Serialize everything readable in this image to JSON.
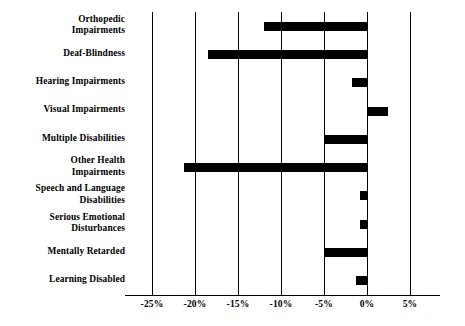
{
  "chart_data": {
    "type": "bar",
    "orientation": "horizontal",
    "title": "",
    "subtitle": "",
    "xlabel": "",
    "ylabel": "",
    "xlim": [
      -27.5,
      7.5
    ],
    "grid": true,
    "legend": null,
    "bar_color": "#000000",
    "axis_color": "#000000",
    "background": "#ffffff",
    "xticks": [
      -25,
      -20,
      -15,
      -10,
      -5,
      0,
      5
    ],
    "xtick_labels": [
      "-25%",
      "-20%",
      "-15%",
      "-10%",
      "-5%",
      "0%",
      "5%"
    ],
    "categories": [
      "Orthopedic\nImpairments",
      "Deaf-Blindness",
      "Hearing Impairments",
      "Visual Impairments",
      "Multiple Disabilities",
      "Other Health\nImpairments",
      "Speech and Language\nDisabilities",
      "Serious Emotional\nDisturbances",
      "Mentally Retarded",
      "Learning Disabled"
    ],
    "values": [
      -12.0,
      -18.5,
      -1.7,
      2.5,
      -4.9,
      -21.3,
      -0.8,
      -0.8,
      -4.9,
      -1.2
    ]
  }
}
